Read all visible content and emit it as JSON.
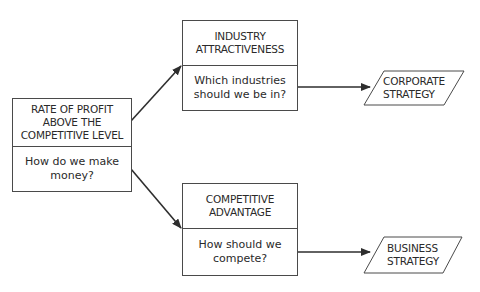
{
  "diagram": {
    "source_box": {
      "title": "RATE OF PROFIT\nABOVE THE\nCOMPETITIVE LEVEL",
      "question": "How do we make\nmoney?"
    },
    "industry_box": {
      "title": "INDUSTRY\nATTRACTIVENESS",
      "question": "Which industries\nshould we be in?"
    },
    "advantage_box": {
      "title": "COMPETITIVE\nADVANTAGE",
      "question": "How should we\ncompete?"
    },
    "corporate_output": {
      "label": "CORPORATE\nSTRATEGY"
    },
    "business_output": {
      "label": "BUSINESS\nSTRATEGY"
    },
    "edges": [
      {
        "from": "source_box",
        "to": "industry_box"
      },
      {
        "from": "source_box",
        "to": "advantage_box"
      },
      {
        "from": "industry_box",
        "to": "corporate_output"
      },
      {
        "from": "advantage_box",
        "to": "business_output"
      }
    ],
    "colors": {
      "line": "#2e2e2e",
      "box_border": "#4a4a4a",
      "text": "#2a2a2a",
      "background": "#ffffff"
    }
  }
}
